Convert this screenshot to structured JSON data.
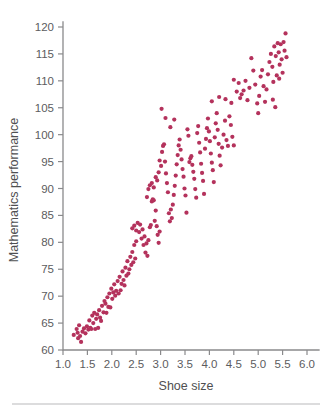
{
  "figure": {
    "background_color": "#ffffff",
    "axis_color": "#8a8a8c",
    "text_color": "#58585a",
    "footer_rule_color": "#b9b9bb"
  },
  "labels": {
    "x_axis_title": "Shoe size",
    "y_axis_title": "Mathematics performance"
  },
  "chart_data": {
    "type": "scatter",
    "title": "",
    "xlabel": "Shoe size",
    "ylabel": "Mathematics performance",
    "xlim": [
      1.0,
      6.0
    ],
    "ylim": [
      60,
      120
    ],
    "xticks": [
      1.0,
      1.5,
      2.0,
      2.5,
      3.0,
      3.5,
      4.0,
      4.5,
      5.0,
      5.5,
      6.0
    ],
    "xtick_labels": [
      "1.0",
      "1.5",
      "2.0",
      "2.5",
      "3.0",
      "3.5",
      "4.0",
      "4.5",
      "5.0",
      "5.5",
      "6.0"
    ],
    "yticks": [
      60,
      65,
      70,
      75,
      80,
      85,
      90,
      95,
      100,
      105,
      110,
      115,
      120
    ],
    "ytick_labels": [
      "60",
      "65",
      "70",
      "75",
      "80",
      "85",
      "90",
      "95",
      "100",
      "105",
      "110",
      "115",
      "120"
    ],
    "grid": false,
    "legend": false,
    "marker_color": "#b4325c",
    "marker_size": 3.1,
    "n_points": 208,
    "relationship": "strong positive linear correlation",
    "points": [
      [
        1.22,
        62.8
      ],
      [
        1.28,
        63.9
      ],
      [
        1.3,
        63.2
      ],
      [
        1.31,
        62.2
      ],
      [
        1.33,
        64.6
      ],
      [
        1.35,
        62.6
      ],
      [
        1.37,
        61.5
      ],
      [
        1.4,
        63.4
      ],
      [
        1.43,
        64.0
      ],
      [
        1.46,
        63.1
      ],
      [
        1.49,
        64.4
      ],
      [
        1.52,
        63.8
      ],
      [
        1.54,
        65.5
      ],
      [
        1.56,
        64.1
      ],
      [
        1.58,
        63.9
      ],
      [
        1.6,
        66.4
      ],
      [
        1.62,
        65.0
      ],
      [
        1.64,
        66.9
      ],
      [
        1.66,
        63.9
      ],
      [
        1.68,
        65.8
      ],
      [
        1.7,
        66.6
      ],
      [
        1.72,
        64.1
      ],
      [
        1.74,
        67.4
      ],
      [
        1.76,
        66.0
      ],
      [
        1.78,
        65.4
      ],
      [
        1.8,
        68.2
      ],
      [
        1.83,
        67.0
      ],
      [
        1.85,
        69.1
      ],
      [
        1.87,
        68.6
      ],
      [
        1.89,
        66.9
      ],
      [
        1.91,
        69.8
      ],
      [
        1.93,
        68.0
      ],
      [
        1.95,
        70.5
      ],
      [
        1.97,
        67.9
      ],
      [
        1.99,
        71.4
      ],
      [
        2.01,
        69.5
      ],
      [
        2.03,
        70.7
      ],
      [
        2.05,
        72.2
      ],
      [
        2.07,
        70.1
      ],
      [
        2.09,
        71.0
      ],
      [
        2.12,
        72.8
      ],
      [
        2.14,
        70.5
      ],
      [
        2.16,
        73.6
      ],
      [
        2.18,
        71.1
      ],
      [
        2.2,
        72.3
      ],
      [
        2.22,
        74.6
      ],
      [
        2.24,
        73.0
      ],
      [
        2.26,
        72.0
      ],
      [
        2.28,
        75.3
      ],
      [
        2.3,
        73.8
      ],
      [
        2.32,
        76.5
      ],
      [
        2.34,
        74.2
      ],
      [
        2.36,
        75.0
      ],
      [
        2.38,
        77.3
      ],
      [
        2.4,
        75.8
      ],
      [
        2.42,
        78.2
      ],
      [
        2.44,
        76.3
      ],
      [
        2.46,
        79.5
      ],
      [
        2.48,
        77.0
      ],
      [
        2.5,
        80.2
      ],
      [
        2.42,
        82.6
      ],
      [
        2.46,
        83.1
      ],
      [
        2.5,
        82.2
      ],
      [
        2.53,
        83.6
      ],
      [
        2.56,
        81.9
      ],
      [
        2.58,
        83.3
      ],
      [
        2.61,
        80.7
      ],
      [
        2.63,
        82.4
      ],
      [
        2.65,
        79.5
      ],
      [
        2.67,
        81.1
      ],
      [
        2.69,
        78.1
      ],
      [
        2.71,
        79.8
      ],
      [
        2.73,
        77.5
      ],
      [
        2.75,
        80.4
      ],
      [
        2.78,
        82.8
      ],
      [
        2.8,
        83.2
      ],
      [
        2.82,
        87.6
      ],
      [
        2.84,
        88.0
      ],
      [
        2.86,
        87.8
      ],
      [
        2.88,
        84.0
      ],
      [
        2.9,
        85.9
      ],
      [
        2.92,
        83.0
      ],
      [
        2.94,
        81.4
      ],
      [
        2.96,
        79.9
      ],
      [
        2.98,
        82.0
      ],
      [
        2.72,
        88.4
      ],
      [
        2.75,
        89.9
      ],
      [
        2.78,
        90.6
      ],
      [
        2.82,
        91.0
      ],
      [
        2.86,
        90.2
      ],
      [
        2.9,
        92.1
      ],
      [
        2.93,
        91.5
      ],
      [
        2.96,
        93.0
      ],
      [
        2.98,
        95.2
      ],
      [
        3.01,
        94.2
      ],
      [
        3.03,
        96.8
      ],
      [
        3.05,
        97.9
      ],
      [
        3.07,
        98.2
      ],
      [
        3.09,
        95.0
      ],
      [
        3.11,
        92.8
      ],
      [
        3.13,
        91.0
      ],
      [
        3.15,
        89.3
      ],
      [
        3.17,
        85.4
      ],
      [
        3.19,
        83.9
      ],
      [
        3.21,
        86.1
      ],
      [
        3.23,
        84.5
      ],
      [
        3.25,
        87.0
      ],
      [
        3.27,
        88.8
      ],
      [
        3.29,
        90.5
      ],
      [
        3.31,
        92.4
      ],
      [
        3.33,
        94.5
      ],
      [
        3.35,
        96.2
      ],
      [
        3.37,
        98.0
      ],
      [
        3.39,
        99.1
      ],
      [
        3.41,
        97.2
      ],
      [
        3.43,
        95.4
      ],
      [
        3.45,
        93.6
      ],
      [
        3.47,
        92.2
      ],
      [
        3.49,
        90.0
      ],
      [
        3.51,
        88.7
      ],
      [
        3.53,
        85.5
      ],
      [
        3.55,
        101.0
      ],
      [
        3.57,
        99.8
      ],
      [
        3.59,
        94.9
      ],
      [
        3.61,
        95.6
      ],
      [
        3.63,
        96.0
      ],
      [
        3.65,
        94.4
      ],
      [
        3.67,
        93.1
      ],
      [
        3.69,
        91.8
      ],
      [
        3.71,
        89.9
      ],
      [
        3.73,
        88.3
      ],
      [
        3.75,
        100.3
      ],
      [
        3.77,
        101.6
      ],
      [
        3.79,
        98.5
      ],
      [
        3.81,
        96.7
      ],
      [
        3.83,
        94.6
      ],
      [
        3.85,
        92.9
      ],
      [
        3.87,
        91.4
      ],
      [
        3.89,
        89.0
      ],
      [
        3.91,
        97.4
      ],
      [
        3.93,
        99.2
      ],
      [
        3.95,
        101.2
      ],
      [
        3.97,
        103.0
      ],
      [
        3.99,
        100.6
      ],
      [
        4.01,
        98.8
      ],
      [
        4.03,
        96.5
      ],
      [
        4.05,
        94.8
      ],
      [
        4.07,
        93.4
      ],
      [
        4.09,
        91.2
      ],
      [
        4.11,
        99.5
      ],
      [
        4.13,
        102.1
      ],
      [
        4.15,
        104.0
      ],
      [
        4.17,
        100.9
      ],
      [
        4.19,
        98.3
      ],
      [
        4.21,
        96.1
      ],
      [
        4.23,
        94.3
      ],
      [
        4.26,
        97.6
      ],
      [
        4.29,
        100.0
      ],
      [
        4.32,
        102.6
      ],
      [
        4.35,
        99.0
      ],
      [
        4.38,
        97.9
      ],
      [
        4.41,
        103.4
      ],
      [
        4.44,
        101.8
      ],
      [
        4.47,
        99.6
      ],
      [
        4.5,
        98.0
      ],
      [
        3.02,
        104.8
      ],
      [
        3.1,
        103.1
      ],
      [
        3.2,
        101.4
      ],
      [
        3.28,
        102.8
      ],
      [
        4.05,
        106.2
      ],
      [
        4.2,
        107.0
      ],
      [
        4.33,
        106.6
      ],
      [
        4.45,
        105.9
      ],
      [
        4.5,
        110.2
      ],
      [
        4.56,
        108.0
      ],
      [
        4.6,
        109.6
      ],
      [
        4.63,
        106.8
      ],
      [
        4.66,
        107.5
      ],
      [
        4.7,
        108.2
      ],
      [
        4.74,
        110.0
      ],
      [
        4.78,
        106.4
      ],
      [
        4.82,
        108.7
      ],
      [
        4.86,
        114.2
      ],
      [
        4.9,
        111.9
      ],
      [
        4.94,
        109.3
      ],
      [
        4.98,
        105.8
      ],
      [
        5.0,
        104.0
      ],
      [
        5.02,
        107.2
      ],
      [
        5.05,
        110.8
      ],
      [
        5.08,
        112.0
      ],
      [
        5.11,
        109.0
      ],
      [
        5.14,
        106.1
      ],
      [
        5.17,
        108.4
      ],
      [
        5.2,
        111.2
      ],
      [
        5.23,
        113.5
      ],
      [
        5.26,
        115.0
      ],
      [
        5.29,
        112.6
      ],
      [
        5.31,
        109.8
      ],
      [
        5.33,
        116.4
      ],
      [
        5.36,
        114.6
      ],
      [
        5.38,
        111.0
      ],
      [
        5.4,
        117.0
      ],
      [
        5.42,
        115.3
      ],
      [
        5.44,
        113.0
      ],
      [
        5.46,
        116.8
      ],
      [
        5.48,
        114.0
      ],
      [
        5.5,
        111.5
      ],
      [
        5.52,
        117.2
      ],
      [
        5.54,
        115.6
      ],
      [
        5.56,
        118.8
      ],
      [
        5.58,
        114.4
      ],
      [
        5.43,
        110.4
      ],
      [
        5.3,
        106.5
      ],
      [
        5.35,
        105.1
      ]
    ]
  }
}
